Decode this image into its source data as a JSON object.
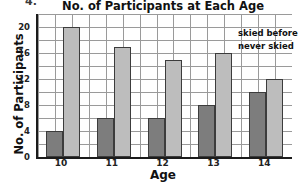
{
  "question_number": "4.",
  "chart_data": {
    "type": "bar",
    "title": "No. of Participants at Each Age",
    "xlabel": "Age",
    "ylabel": "No. of Participants",
    "categories": [
      "10",
      "11",
      "12",
      "13",
      "14"
    ],
    "series": [
      {
        "name": "skied before",
        "color": "#7d7d7d",
        "values": [
          4,
          6,
          6,
          8,
          10
        ]
      },
      {
        "name": "never skied",
        "color": "#bdbdbd",
        "values": [
          20,
          17,
          15,
          16,
          12
        ]
      }
    ],
    "ylim": [
      0,
      22
    ],
    "yticks": [
      0,
      4,
      8,
      12,
      16,
      20
    ],
    "ytick_labels": [
      "0",
      "4",
      "8",
      "12",
      "16",
      "20"
    ],
    "gridlines_minor_step": 2,
    "grid": true,
    "legend_position": "top-right",
    "legend_entries": [
      "skied before",
      "never skied"
    ]
  }
}
